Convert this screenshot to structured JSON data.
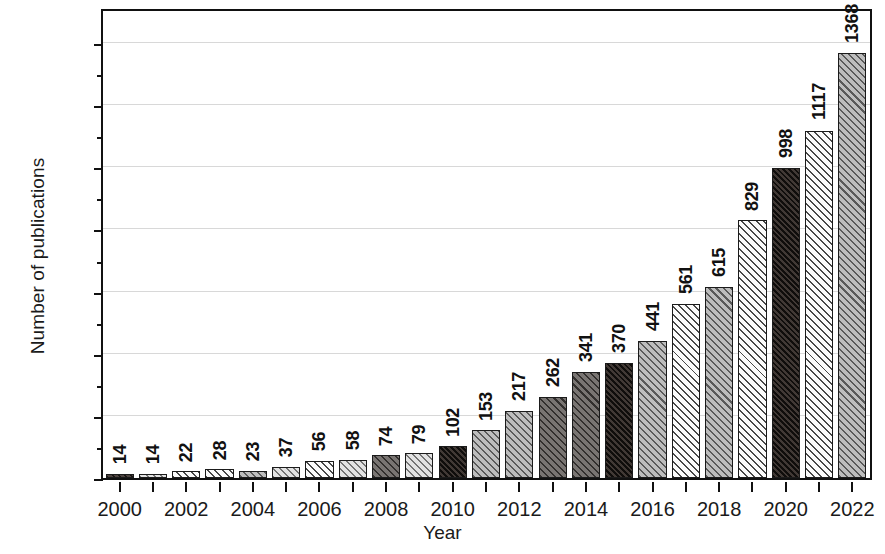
{
  "chart_data": {
    "type": "bar",
    "title": "",
    "xlabel": "Year",
    "ylabel": "Number of publications",
    "categories": [
      2000,
      2001,
      2002,
      2003,
      2004,
      2005,
      2006,
      2007,
      2008,
      2009,
      2010,
      2011,
      2012,
      2013,
      2014,
      2015,
      2016,
      2017,
      2018,
      2019,
      2020,
      2021,
      2022
    ],
    "values": [
      14,
      14,
      22,
      28,
      23,
      37,
      56,
      58,
      74,
      79,
      102,
      153,
      217,
      262,
      341,
      370,
      441,
      561,
      615,
      829,
      998,
      1117,
      1368
    ],
    "bar_fills": [
      "dark",
      "lightgray",
      "white",
      "white",
      "midgray",
      "lightgray",
      "white",
      "lightgray",
      "darkgray",
      "lightgray",
      "solid-dark",
      "midgray",
      "midgray",
      "darkgray",
      "darkgray",
      "solid-dark",
      "midgray",
      "white",
      "midgray",
      "white",
      "solid-dark",
      "white",
      "midgray"
    ],
    "data_labels": [
      "14",
      "14",
      "22",
      "28",
      "23",
      "37",
      "56",
      "58",
      "74",
      "79",
      "102",
      "153",
      "217",
      "262",
      "341",
      "370",
      "441",
      "561",
      "615",
      "829",
      "998",
      "1117",
      "1368"
    ],
    "ylim": [
      0,
      1500
    ],
    "ytick_labels": [
      "0",
      "200",
      "400",
      "600",
      "800",
      "1,000",
      "1,200",
      "1,400"
    ],
    "ytick_values": [
      0,
      200,
      400,
      600,
      800,
      1000,
      1200,
      1400
    ],
    "yminor_values": [
      100,
      300,
      500,
      700,
      900,
      1100,
      1300
    ],
    "xtick_labels": [
      "2000",
      "2002",
      "2004",
      "2006",
      "2008",
      "2010",
      "2012",
      "2014",
      "2016",
      "2018",
      "2020",
      "2022"
    ],
    "xtick_values": [
      2000,
      2002,
      2004,
      2006,
      2008,
      2010,
      2012,
      2014,
      2016,
      2018,
      2020,
      2022
    ],
    "grid": "horizontal",
    "legend": "none",
    "colors": {
      "frame": "#111111",
      "gridline": "#d8d8d8",
      "dark": "#3a302c",
      "darkgray": "#5f5a57",
      "midgray": "#9a9a9a",
      "lightgray": "#c2c2c2",
      "white": "#fbfbfb",
      "solid-dark": "#332a26"
    }
  }
}
